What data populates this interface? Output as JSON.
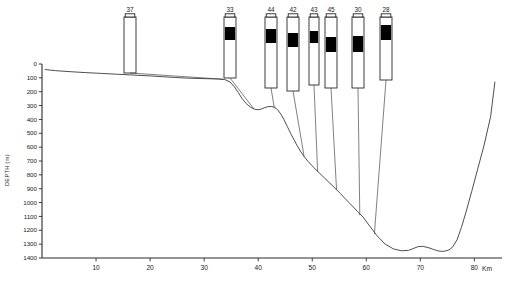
{
  "figure": {
    "type": "bathymetric-profile-with-core-logs",
    "background_color": "#ffffff",
    "line_color": "#3a3a3a",
    "band_color": "#000000"
  },
  "chart_data": {
    "type": "line",
    "title": "",
    "subtitle": "",
    "xlabel": "Km",
    "ylabel": "DEPTH (m)",
    "xlim": [
      0,
      84
    ],
    "ylim": [
      0,
      1400
    ],
    "y_inverted": true,
    "grid": false,
    "legend_position": "none",
    "x_ticks": [
      10,
      20,
      30,
      40,
      50,
      60,
      70,
      80
    ],
    "x_tick_labels": [
      "10",
      "20",
      "30",
      "40",
      "50",
      "60",
      "70",
      "80"
    ],
    "x_unit_label": "Km",
    "y_ticks": [
      0,
      100,
      200,
      300,
      400,
      500,
      600,
      700,
      800,
      900,
      1000,
      1100,
      1200,
      1300,
      1400
    ],
    "y_tick_labels": [
      "0",
      "100",
      "200",
      "300",
      "400",
      "500",
      "600",
      "700",
      "800",
      "900",
      "1000",
      "1100",
      "1200",
      "1300",
      "1400"
    ],
    "series": [
      {
        "name": "seafloor profile",
        "x": [
          0.6,
          2.5,
          5.0,
          8.0,
          11.0,
          14.0,
          17.0,
          20.0,
          22.5,
          24.5,
          26.5,
          28.5,
          30.5,
          32.5,
          33.8,
          34.8,
          35.6,
          36.3,
          37.0,
          37.8,
          38.6,
          39.3,
          40.0,
          40.6,
          41.2,
          41.8,
          42.4,
          43.0,
          43.6,
          44.2,
          44.8,
          45.4,
          46.0,
          46.6,
          47.2,
          47.8,
          48.5,
          49.3,
          50.2,
          51.2,
          52.2,
          53.2,
          54.2,
          55.2,
          56.0,
          56.8,
          57.6,
          58.4,
          59.4,
          60.6,
          62.0,
          63.5,
          65.0,
          66.5,
          67.8,
          68.8,
          69.6,
          70.4,
          71.4,
          72.4,
          73.2,
          73.9,
          74.6,
          75.3,
          76.0,
          76.8,
          77.6,
          78.5,
          79.5,
          80.6,
          81.8,
          83.0,
          83.8
        ],
        "y": [
          40,
          48,
          55,
          62,
          68,
          74,
          80,
          86,
          92,
          97,
          101,
          104,
          106,
          108,
          112,
          130,
          165,
          205,
          248,
          286,
          312,
          326,
          330,
          325,
          315,
          308,
          306,
          312,
          330,
          362,
          404,
          452,
          500,
          545,
          588,
          628,
          668,
          706,
          744,
          782,
          820,
          858,
          896,
          934,
          968,
          1000,
          1032,
          1066,
          1104,
          1168,
          1240,
          1300,
          1334,
          1348,
          1345,
          1330,
          1318,
          1316,
          1324,
          1338,
          1348,
          1352,
          1350,
          1342,
          1320,
          1268,
          1180,
          1062,
          920,
          760,
          585,
          380,
          130
        ],
        "color": "#3a3a3a"
      }
    ],
    "core_logs": [
      {
        "id": "core-37",
        "label": "37",
        "column_x_px": 124,
        "column_top_px": 17,
        "column_bottom_px": 73,
        "column_width_px": 12,
        "band_top_px": null,
        "band_bottom_px": null,
        "has_dark_band": false,
        "tie_point_km": 33.5,
        "tie_point_depth_m": 110
      },
      {
        "id": "core-33",
        "label": "33",
        "column_x_px": 224,
        "column_top_px": 17,
        "column_bottom_px": 78,
        "column_width_px": 12,
        "band_top_px": 27,
        "band_bottom_px": 40,
        "has_dark_band": true,
        "tie_point_km": 39.2,
        "tie_point_depth_m": 324
      },
      {
        "label": "44",
        "id": "core-44",
        "column_x_px": 265,
        "column_top_px": 17,
        "column_bottom_px": 88,
        "column_width_px": 12,
        "band_top_px": 29,
        "band_bottom_px": 43,
        "has_dark_band": true,
        "tie_point_km": 43.0,
        "tie_point_depth_m": 320
      },
      {
        "id": "core-42",
        "label": "42",
        "column_x_px": 287,
        "column_top_px": 17,
        "column_bottom_px": 91,
        "column_width_px": 12,
        "band_top_px": 33,
        "band_bottom_px": 47,
        "has_dark_band": true,
        "tie_point_km": 48.5,
        "tie_point_depth_m": 668
      },
      {
        "id": "core-43",
        "label": "43",
        "column_x_px": 309,
        "column_top_px": 17,
        "column_bottom_px": 85,
        "column_width_px": 10,
        "band_top_px": 31,
        "band_bottom_px": 43,
        "has_dark_band": true,
        "tie_point_km": 51.0,
        "tie_point_depth_m": 778
      },
      {
        "id": "core-45",
        "label": "45",
        "column_x_px": 325,
        "column_top_px": 17,
        "column_bottom_px": 88,
        "column_width_px": 12,
        "band_top_px": 37,
        "band_bottom_px": 52,
        "has_dark_band": true,
        "tie_point_km": 54.5,
        "tie_point_depth_m": 908
      },
      {
        "id": "core-30",
        "label": "30",
        "column_x_px": 352,
        "column_top_px": 17,
        "column_bottom_px": 88,
        "column_width_px": 12,
        "band_top_px": 36,
        "band_bottom_px": 52,
        "has_dark_band": true,
        "tie_point_km": 58.8,
        "tie_point_depth_m": 1092
      },
      {
        "id": "core-28",
        "label": "28",
        "column_x_px": 380,
        "column_top_px": 17,
        "column_bottom_px": 80,
        "column_width_px": 12,
        "band_top_px": 25,
        "band_bottom_px": 40,
        "has_dark_band": true,
        "tie_point_km": 61.5,
        "tie_point_depth_m": 1228
      }
    ]
  }
}
